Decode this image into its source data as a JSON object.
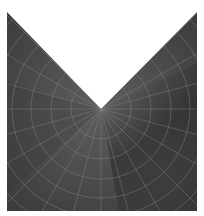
{
  "figure": {
    "colors": {
      "background": "#ffffff",
      "shape_fill_light": "#5a5a5a",
      "shape_fill_mid": "#4a4a4a",
      "shape_fill_dark": "#333333",
      "grid_line": "#8a8a8a"
    },
    "shape": {
      "left": 7,
      "right": 197,
      "top": 12,
      "bottom": 211,
      "apex_x": 101,
      "apex_y": 109
    },
    "polar_grid": {
      "center_x": 101,
      "center_y": 109,
      "circle_radii": [
        30,
        50,
        70,
        89,
        108,
        126
      ],
      "spoke_angles_deg": [
        0,
        15,
        30,
        45,
        60,
        75,
        90,
        105,
        120,
        135,
        150,
        165,
        180,
        195,
        210,
        225,
        240,
        255,
        270,
        285,
        300,
        315,
        330,
        345
      ]
    }
  }
}
